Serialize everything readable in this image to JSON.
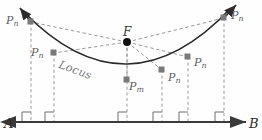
{
  "figure": {
    "title_text_in_image": "",
    "colors": {
      "curve": "#2b2b2b",
      "dashed": "#9a9a9a",
      "marker": "#7a7a7a",
      "focus_marker": "#111111",
      "axis": "#3a3a3a",
      "label": "#5f5f5f",
      "background": "#fefefe"
    },
    "axis": {
      "left_label": "A",
      "right_label": "B",
      "y": 122,
      "x_start": 8,
      "x_end": 254
    },
    "focus": {
      "label": "F",
      "x": 127,
      "y": 42
    },
    "curve": {
      "label": "Locus",
      "type": "parabola"
    },
    "points": [
      {
        "id": "p-left-outer",
        "label": "P",
        "sub": "n",
        "x": 31,
        "y": 22,
        "label_x": 6,
        "label_y": 15
      },
      {
        "id": "p-left-mid",
        "label": "P",
        "sub": "n",
        "x": 54,
        "y": 53,
        "label_x": 31,
        "label_y": 47
      },
      {
        "id": "p-vertex",
        "label": "P",
        "sub": "m",
        "x": 127,
        "y": 80,
        "label_x": 129,
        "label_y": 81
      },
      {
        "id": "p-right-inner",
        "label": "P",
        "sub": "n",
        "x": 162,
        "y": 70,
        "label_x": 168,
        "label_y": 72
      },
      {
        "id": "p-right-mid",
        "label": "P",
        "sub": "n",
        "x": 188,
        "y": 57,
        "label_x": 194,
        "label_y": 57
      },
      {
        "id": "p-right-outer",
        "label": "P",
        "sub": "n",
        "x": 224,
        "y": 18,
        "label_x": 231,
        "label_y": 10
      }
    ],
    "right_angle_marks": [
      {
        "x": 31
      },
      {
        "x": 54
      },
      {
        "x": 127
      },
      {
        "x": 162
      },
      {
        "x": 188
      },
      {
        "x": 224
      }
    ]
  }
}
